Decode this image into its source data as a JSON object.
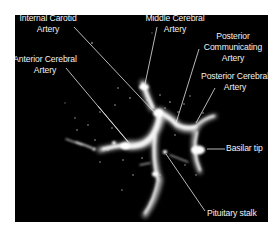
{
  "figure": {
    "type": "transcranial color doppler ultrasound",
    "background_color": "#000000",
    "label_color": "#f2f2f2",
    "labels": [
      {
        "id": "internal-carotid-artery",
        "lines": [
          "Internal Carotid",
          "Artery"
        ]
      },
      {
        "id": "middle-cerebral-artery",
        "lines": [
          "Middle Cerebral",
          "Artery"
        ]
      },
      {
        "id": "posterior-communicating-artery",
        "lines": [
          "Posterior",
          "Communicating",
          "Artery"
        ]
      },
      {
        "id": "anterior-cerebral-artery",
        "lines": [
          "Anterior Cerebral",
          "Artery"
        ]
      },
      {
        "id": "posterior-cerebral-artery",
        "lines": [
          "Posterior Cerebral",
          "Artery"
        ]
      },
      {
        "id": "basilar-tip",
        "lines": [
          "Basilar tip"
        ]
      },
      {
        "id": "pituitary-stalk",
        "lines": [
          "Pituitary stalk"
        ]
      }
    ]
  }
}
